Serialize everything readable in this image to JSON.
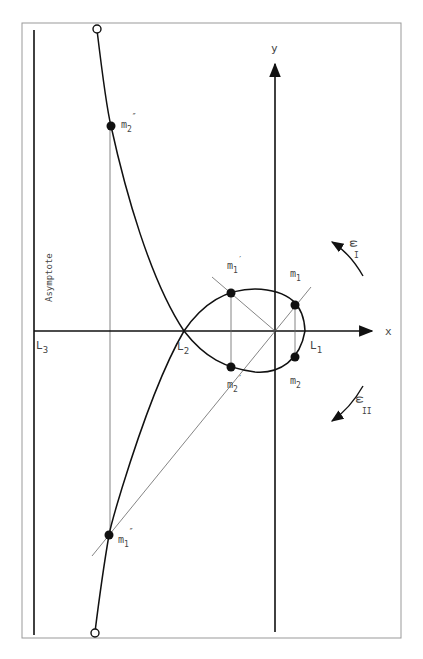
{
  "figure": {
    "axes": {
      "x_label": "x",
      "y_label": "y"
    },
    "asymptote_label": "Asymptote",
    "libration_points": [
      {
        "name": "L",
        "sub": "1"
      },
      {
        "name": "L",
        "sub": "2"
      },
      {
        "name": "L",
        "sub": "3"
      }
    ],
    "points": [
      {
        "name": "m",
        "sub": "1",
        "prime": ""
      },
      {
        "name": "m",
        "sub": "2",
        "prime": ""
      },
      {
        "name": "m",
        "sub": "1",
        "prime": "′"
      },
      {
        "name": "m",
        "sub": "2",
        "prime": "′"
      },
      {
        "name": "m",
        "sub": "1",
        "prime": "″"
      },
      {
        "name": "m",
        "sub": "2",
        "prime": "″"
      }
    ],
    "rotations": [
      {
        "symbol": "ω",
        "sub": "I",
        "direction": "counter-clockwise"
      },
      {
        "symbol": "ω",
        "sub": "II",
        "direction": "clockwise"
      }
    ],
    "colors": {
      "ink": "#111111",
      "thin": "#555555",
      "frame": "#999999",
      "text": "#444444"
    }
  }
}
